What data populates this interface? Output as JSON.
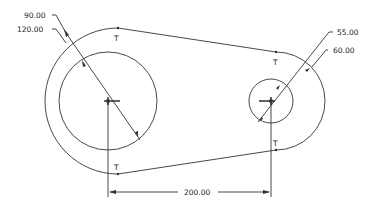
{
  "diagram": {
    "type": "cad-sketch-link",
    "colors": {
      "line": "#333333",
      "background": "#ffffff"
    },
    "dimensions": {
      "left_inner_diameter": "90.00",
      "left_outer_diameter": "120.00",
      "right_inner_diameter": "55.00",
      "right_outer_diameter": "60.00",
      "center_distance": "200.00"
    },
    "constraint_marks": {
      "tangent_top_left": "T",
      "tangent_top_right": "T",
      "tangent_bottom_left": "T",
      "tangent_bottom_right": "T"
    }
  }
}
